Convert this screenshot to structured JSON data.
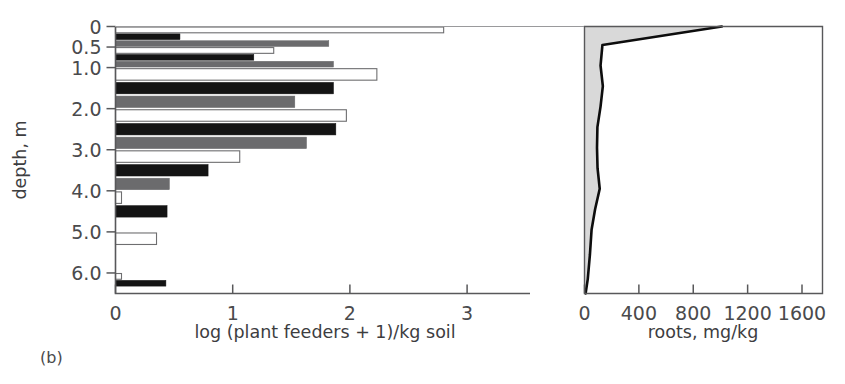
{
  "figure": {
    "panel_label": "(b)",
    "background": "#ffffff"
  },
  "left_panel": {
    "y_axis_title": "depth, m",
    "x_axis_title": "log (plant feeders + 1)/kg soil",
    "x_ticks": [
      "0",
      "1",
      "2",
      "3"
    ],
    "y_ticks": [
      "0",
      "0.5",
      "1.0",
      "2.0",
      "3.0",
      "4.0",
      "5.0",
      "6.0"
    ]
  },
  "right_panel": {
    "x_axis_title": "roots, mg/kg",
    "x_ticks": [
      "0",
      "400",
      "800",
      "1200",
      "1600"
    ]
  },
  "colors": {
    "open_bar": "#ffffff",
    "black_bar": "#141414",
    "gray_bar": "#6b6b6d",
    "roots_fill": "#d9d9d9",
    "roots_line": "#0d0d0d",
    "axis": "#58585a"
  },
  "chart_data": [
    {
      "type": "bar",
      "id": "plant-feeders",
      "orientation": "horizontal",
      "title": "",
      "xlabel": "log (plant feeders + 1)/kg soil",
      "ylabel": "depth, m",
      "xlim": [
        0,
        3.55
      ],
      "ylim": [
        0,
        6.5
      ],
      "y_inverted": true,
      "grid": false,
      "legend": "none",
      "xticks": [
        0,
        1,
        2,
        3
      ],
      "yticks": [
        0,
        0.5,
        1.0,
        2.0,
        3.0,
        4.0,
        5.0,
        6.0
      ],
      "categories": [
        "0-0.5",
        "0.5-1.0",
        "1.0-2.0",
        "2.0-3.0",
        "3.0-4.0",
        "4.0-5.0",
        "5.0-6.0",
        "6.0-6.5"
      ],
      "group_depth_top": [
        0.0,
        0.5,
        1.0,
        2.0,
        3.0,
        4.0,
        5.0,
        6.0
      ],
      "series": [
        {
          "name": "open",
          "style": "white-outline",
          "values": [
            2.8,
            1.35,
            2.23,
            1.97,
            1.06,
            0.0,
            0.35,
            0.0
          ]
        },
        {
          "name": "black",
          "style": "solid-black",
          "values": [
            0.55,
            1.18,
            1.86,
            1.88,
            0.79,
            0.44,
            0.0,
            0.43
          ]
        },
        {
          "name": "gray",
          "style": "solid-gray",
          "values": [
            1.82,
            1.86,
            1.53,
            1.63,
            0.46,
            0.0,
            0.0,
            0.0
          ]
        }
      ]
    },
    {
      "type": "area",
      "id": "roots",
      "orientation": "horizontal-depth",
      "title": "",
      "xlabel": "roots, mg/kg",
      "ylabel": "depth, m",
      "xlim": [
        0,
        1800
      ],
      "ylim": [
        0,
        6.5
      ],
      "y_inverted": true,
      "grid": false,
      "legend": "none",
      "xticks": [
        0,
        400,
        800,
        1200,
        1600
      ],
      "depth_m": [
        0.0,
        0.45,
        0.95,
        1.45,
        1.95,
        2.45,
        2.95,
        3.45,
        3.95,
        4.45,
        4.95,
        5.55,
        6.15,
        6.5
      ],
      "values": [
        1010,
        132,
        118,
        135,
        118,
        95,
        92,
        96,
        112,
        78,
        52,
        40,
        24,
        8
      ]
    }
  ]
}
